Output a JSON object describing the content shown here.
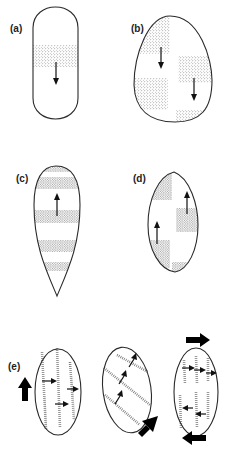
{
  "figure": {
    "panels": [
      {
        "id": "a",
        "label": "(a)",
        "shape": "capsule",
        "arrows": [
          "down"
        ]
      },
      {
        "id": "b",
        "label": "(b)",
        "shape": "egg",
        "arrows": [
          "down",
          "down"
        ]
      },
      {
        "id": "c",
        "label": "(c)",
        "shape": "teardrop",
        "arrows": [
          "up"
        ]
      },
      {
        "id": "d",
        "label": "(d)",
        "shape": "lens",
        "arrows": [
          "up",
          "up"
        ]
      },
      {
        "id": "e",
        "label": "(e)",
        "shape": "ovals-series",
        "arrows": [
          "right",
          "right",
          "right",
          "up-right",
          "up-right",
          "up-right",
          "right",
          "right",
          "right",
          "left",
          "left"
        ],
        "large_arrows": [
          "up",
          "up-right",
          "right",
          "left"
        ]
      }
    ]
  },
  "colors": {
    "stroke": "#2a2a2a",
    "stipple": "#555555",
    "background": "#ffffff"
  }
}
